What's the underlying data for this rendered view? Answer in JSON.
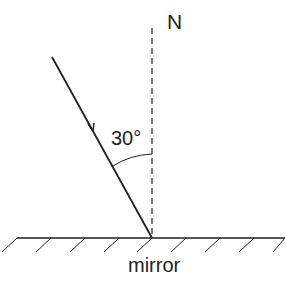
{
  "diagram": {
    "normal_label": "N",
    "angle_label": "30°",
    "mirror_label": "mirror",
    "angle_of_incidence_deg": 30,
    "colors": {
      "ink": "#231f20",
      "background": "#ffffff"
    }
  }
}
